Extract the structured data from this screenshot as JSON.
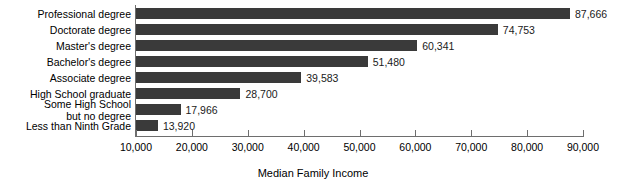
{
  "chart_data": {
    "type": "bar",
    "orientation": "horizontal",
    "title": "",
    "xlabel": "Median Family Income",
    "ylabel": "",
    "xlim": [
      10000,
      90000
    ],
    "grid": false,
    "legend": false,
    "bar_color": "#3a3a3a",
    "axis_color": "#6e6e6e",
    "categories": [
      "Professional degree",
      "Doctorate degree",
      "Master's degree",
      "Bachelor's degree",
      "Associate degree",
      "High School graduate",
      "Some High School\nbut no degree",
      "Less than Ninth Grade"
    ],
    "values": [
      87666,
      74753,
      60341,
      51480,
      39583,
      28700,
      17966,
      13920
    ],
    "value_labels": [
      "87,666",
      "74,753",
      "60,341",
      "51,480",
      "39,583",
      "28,700",
      "17,966",
      "13,920"
    ],
    "xticks": [
      10000,
      20000,
      30000,
      40000,
      50000,
      60000,
      70000,
      80000,
      90000
    ],
    "xtick_labels": [
      "10,000",
      "20,000",
      "30,000",
      "40,000",
      "50,000",
      "60,000",
      "70,000",
      "80,000",
      "90,000"
    ]
  }
}
